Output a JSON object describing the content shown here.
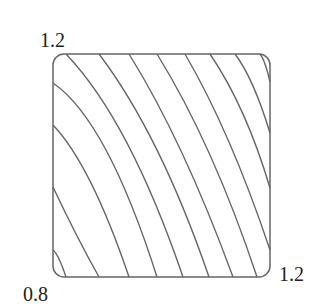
{
  "labels": {
    "top_left": "1.2",
    "bottom_left": "0.8",
    "bottom_right": "1.2"
  },
  "colors": {
    "stroke": "#666666",
    "text": "#222222",
    "background": "#ffffff"
  },
  "box": {
    "x": 53,
    "y": 54,
    "width": 217,
    "height": 223,
    "radius": 11
  },
  "curves": [
    [
      [
        53,
        250
      ],
      [
        59,
        259
      ],
      [
        66,
        277
      ]
    ],
    [
      [
        53,
        187
      ],
      [
        76,
        234
      ],
      [
        99,
        277
      ]
    ],
    [
      [
        53,
        125
      ],
      [
        91,
        183
      ],
      [
        129,
        277
      ]
    ],
    [
      [
        53,
        83
      ],
      [
        106,
        150
      ],
      [
        157,
        277
      ]
    ],
    [
      [
        66,
        54
      ],
      [
        127,
        143
      ],
      [
        183,
        277
      ]
    ],
    [
      [
        99,
        54
      ],
      [
        157,
        150
      ],
      [
        209,
        277
      ]
    ],
    [
      [
        129,
        54
      ],
      [
        182,
        153
      ],
      [
        233,
        277
      ]
    ],
    [
      [
        157,
        54
      ],
      [
        210,
        155
      ],
      [
        257,
        277
      ]
    ],
    [
      [
        185,
        54
      ],
      [
        229,
        142
      ],
      [
        270,
        250
      ]
    ],
    [
      [
        210,
        54
      ],
      [
        243,
        114
      ],
      [
        270,
        188
      ]
    ],
    [
      [
        235,
        54
      ],
      [
        253,
        86
      ],
      [
        270,
        133
      ]
    ],
    [
      [
        260,
        54
      ],
      [
        265,
        64
      ],
      [
        270,
        82
      ]
    ]
  ]
}
